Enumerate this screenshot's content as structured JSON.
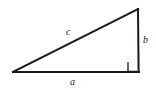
{
  "figure": {
    "kind": "right-triangle-diagram",
    "background_color": "#ffffff",
    "stroke_color": "#1a1a1a",
    "stroke_width": 2,
    "canvas": {
      "width": 156,
      "height": 90
    }
  },
  "labels": {
    "hypotenuse": "c",
    "vertical_leg": "b",
    "horizontal_leg": "a"
  },
  "geometry": {
    "vertices": {
      "left": {
        "x": 13,
        "y": 72
      },
      "bottom_right": {
        "x": 139,
        "y": 72
      },
      "top_right": {
        "x": 138,
        "y": 9
      }
    },
    "right_angle_marker": {
      "at_vertex": "bottom_right",
      "size": 10,
      "x": 128,
      "y": 62
    }
  }
}
